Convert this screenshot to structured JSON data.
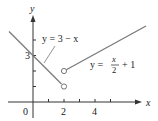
{
  "figure": {
    "type": "piecewise-function-graph",
    "axes": {
      "x_label": "x",
      "y_label": "y",
      "x_ticks": [
        1,
        2,
        3,
        4,
        5
      ],
      "x_tick_labels": [
        {
          "value": 0,
          "text": "0"
        },
        {
          "value": 2,
          "text": "2"
        },
        {
          "value": 4,
          "text": "4"
        }
      ],
      "y_ticks": [
        1,
        2,
        3,
        4
      ],
      "y_tick_labels": [
        {
          "value": 3,
          "text": "3"
        }
      ]
    },
    "pieces": [
      {
        "expression": "y = 3 − x",
        "label_left": "y = 3 − x",
        "domain": "x < 2",
        "endpoint": {
          "x": 2,
          "y": 1,
          "open": true
        }
      },
      {
        "expression": "y = x/2 + 1",
        "label_prefix": "y = ",
        "label_num": "x",
        "label_den": "2",
        "label_suffix": "+ 1",
        "domain": "x > 2",
        "endpoint": {
          "x": 2,
          "y": 2,
          "open": true
        }
      }
    ],
    "colors": {
      "line": "#7a7a7a",
      "axis": "#333333",
      "text": "#222222"
    }
  }
}
